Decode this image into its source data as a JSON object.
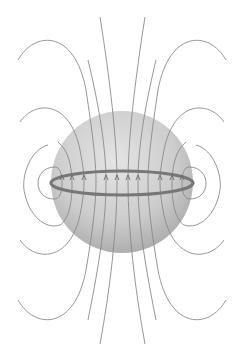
{
  "diagram": {
    "title": "",
    "colors": {
      "background": "#ffffff",
      "sphere_light": "#e2e2e2",
      "sphere_dark": "#a9a9a9",
      "field_line": "#8a8a8a",
      "ring": "#777777",
      "arrow": "#6a6a6a"
    },
    "elements": {
      "sphere": "shaded sphere",
      "ring": "equatorial ring",
      "field_lines": "magnetic field lines",
      "arrows": "upward field direction arrows"
    },
    "field_line_count": 12,
    "arrow_direction": "up",
    "arrow_count": 10
  }
}
